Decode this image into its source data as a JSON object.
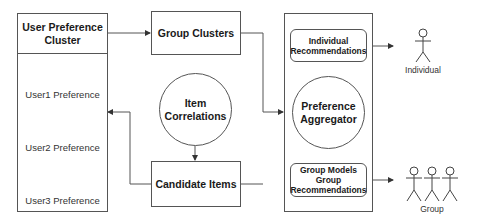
{
  "diagram": {
    "user_cluster": {
      "title": "User Preference Cluster",
      "users": [
        {
          "label": "User1 Preference"
        },
        {
          "label": "User2 Preference"
        },
        {
          "label": "User3 Preference"
        }
      ]
    },
    "group_clusters": {
      "label": "Group Clusters"
    },
    "item_correlations": {
      "label": "Item Correlations"
    },
    "candidate_items": {
      "label": "Candidate Items"
    },
    "aggregator_container": {
      "individual_recs": {
        "label": "Individual Recommendations"
      },
      "aggregator": {
        "label": "Preference Aggregator"
      },
      "group_recs": {
        "label": "Group Models Group Recommendations"
      }
    },
    "outputs": {
      "individual": {
        "label": "Individual"
      },
      "group": {
        "label": "Group"
      }
    },
    "colors": {
      "stroke": "#555555",
      "text": "#1a1a1a",
      "background": "#ffffff"
    }
  }
}
